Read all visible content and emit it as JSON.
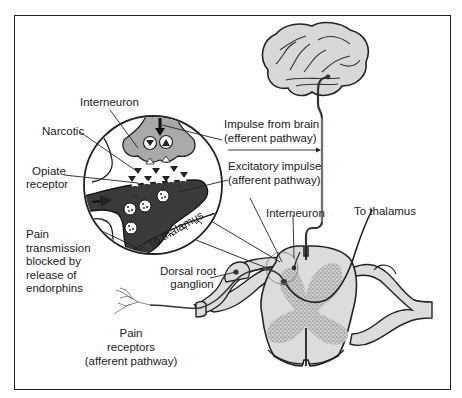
{
  "diagram": {
    "colors": {
      "frame": "#222222",
      "tissue_light": "#dcdcdc",
      "interneuron_gray": "#a9a9a9",
      "afferent_dark": "#3a3a3a",
      "line": "#222222",
      "background": "#ffffff"
    },
    "labels": {
      "interneuron_top": "Interneuron",
      "narcotic": "Narcotic",
      "opiate_receptor_1": "Opiate",
      "opiate_receptor_2": "receptor",
      "impulse_from_brain_1": "Impulse from brain",
      "impulse_from_brain_2": "(efferent pathway)",
      "excitatory_impulse_1": "Excitatory impulse",
      "excitatory_impulse_2": "(afferent pathway)",
      "interneuron_cord": "Interneuron",
      "to_thalamus_right": "To thalamus",
      "to_thalamus_inset": "To thalamus",
      "pain_blocked_1": "Pain",
      "pain_blocked_2": "transmission",
      "pain_blocked_3": "blocked by",
      "pain_blocked_4": "release of",
      "pain_blocked_5": "endorphins",
      "dorsal_root_1": "Dorsal root",
      "dorsal_root_2": "ganglion",
      "pain_receptors_1": "Pain",
      "pain_receptors_2": "receptors",
      "pain_receptors_3": "(afferent pathway)"
    },
    "elements": [
      {
        "name": "brain",
        "icon": "brain-icon"
      },
      {
        "name": "magnified-synapse-inset",
        "icon": "magnifier-circle"
      },
      {
        "name": "spinal-cord-cross-section",
        "icon": "spinal-cord-icon"
      },
      {
        "name": "dorsal-root-ganglion",
        "icon": "ganglion-icon"
      },
      {
        "name": "pain-receptor-endings",
        "icon": "nerve-ending-icon"
      }
    ]
  }
}
